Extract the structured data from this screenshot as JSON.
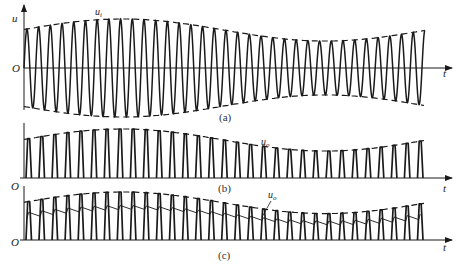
{
  "figure": {
    "colors": {
      "stroke": "#1a1a1a",
      "background": "#ffffff"
    },
    "panels": [
      {
        "id": "a",
        "caption": "(a)",
        "y_axis_label": "u",
        "x_axis_label": "t",
        "origin_label": "O",
        "signal_label": "u",
        "signal_label_sub": "i",
        "waveform": "full-sine carrier with symmetric dashed envelope",
        "cycles": 34
      },
      {
        "id": "b",
        "caption": "(b)",
        "x_axis_label": "t",
        "origin_label": "O",
        "signal_label": "u",
        "signal_label_sub": "o",
        "waveform": "rectified positive pulses under dashed envelope",
        "pulses": 31
      },
      {
        "id": "c",
        "caption": "(c)",
        "x_axis_label": "t",
        "origin_label": "O",
        "signal_label": "u",
        "signal_label_sub": "o",
        "waveform": "rectified pulses with sawtooth-like filtered output ripple under dashed envelope",
        "pulses": 31
      }
    ]
  }
}
